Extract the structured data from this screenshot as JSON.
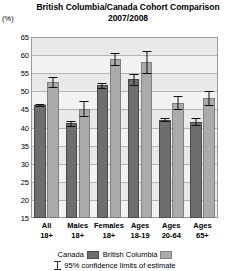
{
  "chart_data": {
    "type": "bar",
    "title": "British Columbia/Canada Cohort Comparison",
    "subtitle": "2007/2008",
    "xlabel": "",
    "ylabel": "(%)",
    "ylim": [
      15,
      65
    ],
    "yticks": [
      15,
      20,
      25,
      30,
      35,
      40,
      45,
      50,
      55,
      60,
      65
    ],
    "grid": true,
    "legend_position": "bottom",
    "categories": [
      {
        "line1": "All",
        "line2": "18+"
      },
      {
        "line1": "Males",
        "line2": "18+"
      },
      {
        "line1": "Females",
        "line2": "18+"
      },
      {
        "line1": "Ages",
        "line2": "18-19"
      },
      {
        "line1": "Ages",
        "line2": "20-64"
      },
      {
        "line1": "Ages",
        "line2": "65+"
      }
    ],
    "series": [
      {
        "name": "Canada",
        "color": "#6e6e6e",
        "values": [
          46.2,
          41.2,
          51.7,
          53.3,
          42.2,
          41.6
        ],
        "err_low": [
          45.8,
          40.5,
          51.0,
          51.7,
          41.8,
          40.6
        ],
        "err_high": [
          46.6,
          41.9,
          52.4,
          54.9,
          42.6,
          42.6
        ]
      },
      {
        "name": "British Columbia",
        "color": "#aaaaaa",
        "values": [
          52.6,
          45.2,
          59.0,
          58.0,
          46.9,
          48.1
        ],
        "err_low": [
          51.3,
          43.2,
          57.4,
          55.0,
          45.2,
          46.1
        ],
        "err_high": [
          53.9,
          47.2,
          60.6,
          61.0,
          48.6,
          50.1
        ]
      }
    ],
    "note": "95% confidence limits of estimate"
  },
  "legend": {
    "canada_label": "Canada",
    "bc_label": "British Columbia",
    "note_label": "95% confidence limits of estimate"
  }
}
